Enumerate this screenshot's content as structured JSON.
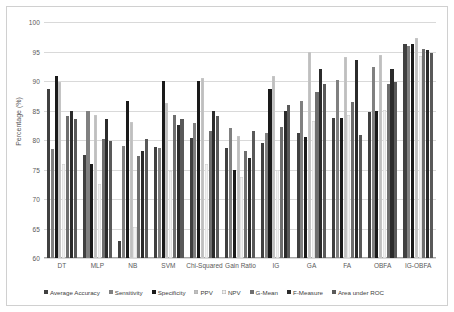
{
  "chart_data": {
    "type": "bar",
    "title": "",
    "xlabel": "",
    "ylabel": "Percentage (%)",
    "ylim": [
      60,
      100
    ],
    "yticks": [
      60,
      65,
      70,
      75,
      80,
      85,
      90,
      95,
      100
    ],
    "grid": true,
    "legend_position": "bottom",
    "categories": [
      "DT",
      "MLP",
      "NB",
      "SVM",
      "Chi-Squared",
      "Gain Ratio",
      "IG",
      "GA",
      "FA",
      "OBFA",
      "IG-OBFA"
    ],
    "series": [
      {
        "name": "Average Accuracy",
        "color": "#404040",
        "values": [
          88.6,
          77.4,
          62.9,
          78.8,
          80.4,
          78.6,
          79.5,
          81.2,
          83.8,
          84.8,
          96.3
        ]
      },
      {
        "name": "Sensitivity",
        "color": "#808080",
        "values": [
          78.5,
          85.0,
          79.0,
          78.6,
          82.9,
          82.0,
          81.2,
          86.6,
          90.2,
          92.3,
          95.9
        ]
      },
      {
        "name": "Specificity",
        "color": "#1a1a1a",
        "values": [
          90.9,
          76.0,
          86.6,
          90.0,
          90.0,
          74.9,
          88.7,
          80.5,
          83.8,
          84.9,
          96.2
        ]
      },
      {
        "name": "PPV",
        "color": "#bfbfbf",
        "values": [
          89.9,
          84.2,
          83.1,
          86.3,
          90.5,
          80.7,
          90.9,
          95.0,
          94.0,
          94.4,
          97.3
        ]
      },
      {
        "name": "NPV",
        "color": "#f2f2f2",
        "values": [
          75.9,
          72.5,
          65.2,
          74.8,
          76.0,
          73.8,
          74.9,
          83.2,
          84.2,
          85.1,
          94.3
        ]
      },
      {
        "name": "G-Mean",
        "color": "#6e6e6e",
        "values": [
          84.0,
          80.2,
          77.3,
          84.3,
          81.5,
          78.2,
          82.2,
          88.1,
          86.5,
          89.5,
          95.4
        ]
      },
      {
        "name": "F-Measure",
        "color": "#2b2b2b",
        "values": [
          84.9,
          83.5,
          78.1,
          82.6,
          85.0,
          76.9,
          85.0,
          92.0,
          93.6,
          92.1,
          95.2
        ]
      },
      {
        "name": "Area under ROC",
        "color": "#595959",
        "values": [
          83.5,
          79.8,
          80.2,
          83.6,
          84.0,
          81.6,
          86.0,
          89.5,
          80.9,
          89.8,
          94.8
        ]
      }
    ]
  },
  "axis": {
    "y_label": "Percentage (%)",
    "y_tick_labels": [
      "100",
      "95",
      "90",
      "85",
      "80",
      "75",
      "70",
      "65",
      "60"
    ]
  }
}
